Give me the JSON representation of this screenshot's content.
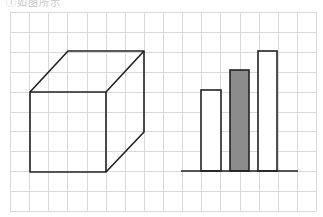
{
  "caption": "①如图所示",
  "grid": {
    "x0": 10,
    "y0": 12,
    "cols": 16,
    "rows": 10,
    "cell_w": 19.125,
    "cell_h": 19.9,
    "line_color": "#d9d9d9"
  },
  "cube": {
    "stroke": "#222222",
    "front": {
      "x1": 30,
      "y1": 92,
      "x2": 106,
      "y2": 172
    },
    "back_top_left": [
      68,
      51
    ],
    "back_top_right": [
      144,
      51
    ],
    "back_bottom_right": [
      144,
      132
    ]
  },
  "bars": {
    "baseline": {
      "x1": 181,
      "x2": 298,
      "y": 171
    },
    "items": [
      {
        "label": "bar-1",
        "x": 201,
        "width": 20,
        "top": 90,
        "fill": "#ffffff"
      },
      {
        "label": "bar-2",
        "x": 230,
        "width": 19,
        "top": 70,
        "fill": "#8c8c8c"
      },
      {
        "label": "bar-3",
        "x": 258,
        "width": 19,
        "top": 51,
        "fill": "#ffffff"
      }
    ],
    "stroke": "#222222"
  }
}
